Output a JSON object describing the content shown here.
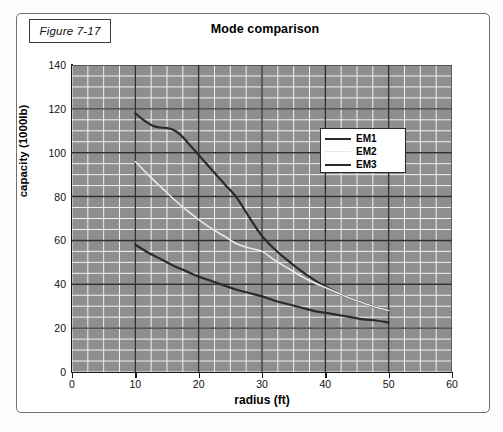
{
  "figure": {
    "tag": "Figure 7-17",
    "title": "Mode comparison"
  },
  "chart_data": {
    "type": "line",
    "title": "Mode comparison",
    "xlabel": "radius (ft)",
    "ylabel": "capacity (1000lb)",
    "xlim": [
      0,
      60
    ],
    "ylim": [
      0,
      140
    ],
    "xticks": [
      0,
      10,
      20,
      30,
      40,
      50,
      60
    ],
    "yticks": [
      0,
      20,
      40,
      60,
      80,
      100,
      120,
      140
    ],
    "x_minor_step": 2.5,
    "y_minor_step": 5,
    "grid": true,
    "legend_position": "center-right",
    "plot_background": "#8e8e8e",
    "gridline_minor_color": "#f2f2f2",
    "gridline_major_color": "#303030",
    "series": [
      {
        "name": "EM1",
        "color": "#2b2b2b",
        "width": 2.2,
        "x": [
          10,
          11,
          12,
          13,
          14,
          15,
          16,
          17,
          18,
          20,
          22,
          24,
          26,
          28,
          30,
          32,
          34,
          36,
          38,
          40,
          42,
          44,
          46,
          48,
          50
        ],
        "y": [
          118,
          115.5,
          113.5,
          112,
          111.5,
          111.2,
          110.5,
          108.5,
          105.5,
          99,
          92.5,
          86,
          79.5,
          70.5,
          62,
          56,
          51,
          46.5,
          42.5,
          39,
          36,
          33.5,
          31.5,
          29.5,
          28
        ]
      },
      {
        "name": "EM2",
        "color": "#e8e8e8",
        "width": 1.6,
        "x": [
          10,
          12,
          14,
          16,
          18,
          20,
          22,
          24,
          26,
          28,
          30,
          32,
          34,
          36,
          38,
          40,
          42,
          44,
          46,
          48,
          50
        ],
        "y": [
          96,
          90,
          84.5,
          79,
          74,
          69.5,
          65.5,
          62,
          58.5,
          56.5,
          55,
          51,
          47.5,
          44,
          41,
          38.5,
          36,
          33.5,
          31.5,
          29.5,
          28
        ]
      },
      {
        "name": "EM3",
        "color": "#2b2b2b",
        "width": 2.2,
        "x": [
          10,
          12,
          14,
          16,
          18,
          20,
          22,
          24,
          26,
          28,
          30,
          32,
          34,
          36,
          38,
          40,
          42,
          44,
          46,
          48,
          50
        ],
        "y": [
          58,
          54.5,
          51.5,
          48.5,
          46,
          43.5,
          41.5,
          39.5,
          37.5,
          36,
          34.5,
          32.5,
          31,
          29.5,
          28,
          27,
          26,
          25,
          24,
          23.5,
          22.5
        ]
      }
    ]
  }
}
